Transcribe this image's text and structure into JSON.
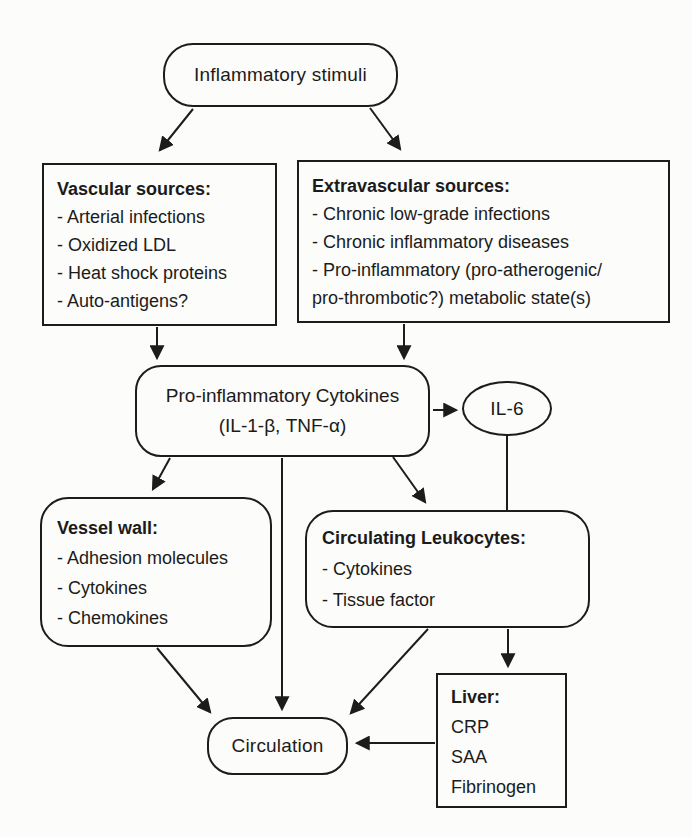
{
  "page": {
    "background_color": "#fcfcfa",
    "ink_color": "#1c1c1c"
  },
  "diagram": {
    "nodes": {
      "inflammatory_stimuli": {
        "shape": "rounded",
        "label": "Inflammatory stimuli"
      },
      "vascular_sources": {
        "shape": "rect",
        "title": "Vascular sources:",
        "items": [
          "- Arterial infections",
          "- Oxidized LDL",
          "- Heat shock proteins",
          "- Auto-antigens?"
        ]
      },
      "extravascular_sources": {
        "shape": "rect",
        "title": "Extravascular sources:",
        "items": [
          "- Chronic low-grade infections",
          "- Chronic inflammatory diseases",
          "- Pro-inflammatory (pro-atherogenic/\n  pro-thrombotic?) metabolic state(s)"
        ]
      },
      "pro_inflammatory_cytokines": {
        "shape": "rounded",
        "line1": "Pro-inflammatory Cytokines",
        "line2": "(IL-1-β, TNF-α)"
      },
      "il6": {
        "shape": "ellipse",
        "label": "IL-6"
      },
      "vessel_wall": {
        "shape": "rounded",
        "title": "Vessel wall:",
        "items": [
          "- Adhesion molecules",
          "- Cytokines",
          "- Chemokines"
        ]
      },
      "circulating_leukocytes": {
        "shape": "rounded",
        "title": "Circulating Leukocytes:",
        "items": [
          "- Cytokines",
          "- Tissue factor"
        ]
      },
      "circulation": {
        "shape": "rounded",
        "label": "Circulation"
      },
      "liver": {
        "shape": "rect",
        "title": "Liver:",
        "items": [
          "CRP",
          "SAA",
          "Fibrinogen"
        ]
      }
    },
    "edges": [
      {
        "from": "inflammatory_stimuli",
        "to": "vascular_sources",
        "arrowhead": true
      },
      {
        "from": "inflammatory_stimuli",
        "to": "extravascular_sources",
        "arrowhead": true
      },
      {
        "from": "vascular_sources",
        "to": "pro_inflammatory_cytokines",
        "arrowhead": true
      },
      {
        "from": "extravascular_sources",
        "to": "pro_inflammatory_cytokines",
        "arrowhead": true
      },
      {
        "from": "pro_inflammatory_cytokines",
        "to": "il6",
        "arrowhead": true
      },
      {
        "from": "pro_inflammatory_cytokines",
        "to": "vessel_wall",
        "arrowhead": true
      },
      {
        "from": "pro_inflammatory_cytokines",
        "to": "circulation",
        "arrowhead": true
      },
      {
        "from": "pro_inflammatory_cytokines",
        "to": "circulating_leukocytes",
        "arrowhead": true
      },
      {
        "from": "il6",
        "to": "circulating_leukocytes",
        "arrowhead": false
      },
      {
        "from": "circulating_leukocytes",
        "to": "liver",
        "arrowhead": true
      },
      {
        "from": "vessel_wall",
        "to": "circulation",
        "arrowhead": true
      },
      {
        "from": "circulating_leukocytes",
        "to": "circulation",
        "arrowhead": true
      },
      {
        "from": "liver",
        "to": "circulation",
        "arrowhead": true
      }
    ]
  }
}
